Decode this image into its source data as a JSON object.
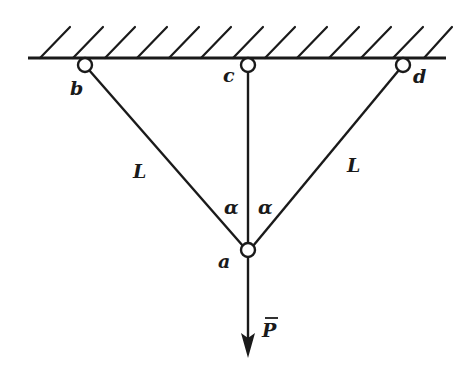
{
  "diagram": {
    "type": "truss-structure",
    "colors": {
      "stroke": "#1a1a1a",
      "background": "#ffffff"
    },
    "nodes": {
      "b": {
        "label": "b"
      },
      "c": {
        "label": "c"
      },
      "d": {
        "label": "d"
      },
      "a": {
        "label": "a"
      }
    },
    "members": [
      {
        "from": "b",
        "to": "a",
        "length_label": "L"
      },
      {
        "from": "c",
        "to": "a",
        "length_label": ""
      },
      {
        "from": "d",
        "to": "a",
        "length_label": "L"
      }
    ],
    "angles": {
      "left": "α",
      "right": "α"
    },
    "load": {
      "label": "P",
      "node": "a",
      "direction": "down"
    },
    "support": {
      "type": "fixed-ceiling"
    }
  }
}
